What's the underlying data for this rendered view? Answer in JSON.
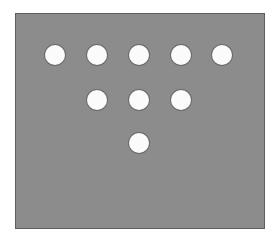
{
  "figure": {
    "background_color": "#8c8c8c",
    "dot_color": "#fbfbfb",
    "dot_radius": 10,
    "rows": [
      {
        "count": 5,
        "y": 55,
        "x": [
          55,
          97,
          139,
          181,
          222
        ]
      },
      {
        "count": 3,
        "y": 100,
        "x": [
          97,
          139,
          181
        ]
      },
      {
        "count": 1,
        "y": 143,
        "x": [
          139
        ]
      }
    ],
    "total_dots": 9
  }
}
